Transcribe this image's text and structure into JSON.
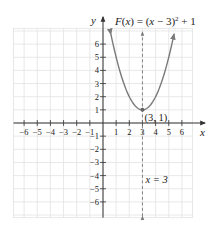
{
  "chart_data": {
    "type": "line",
    "function": {
      "name": "F",
      "expression": "(x - 3)^2 + 1",
      "label": "F(x) = (x − 3)² + 1",
      "color": "#7a7a7a",
      "x_domain": [
        0.6,
        5.4
      ],
      "points": [
        {
          "x": 0.6,
          "y": 6.76
        },
        {
          "x": 1,
          "y": 5
        },
        {
          "x": 2,
          "y": 2
        },
        {
          "x": 3,
          "y": 1
        },
        {
          "x": 4,
          "y": 2
        },
        {
          "x": 5,
          "y": 5
        },
        {
          "x": 5.4,
          "y": 6.76
        }
      ]
    },
    "vertex": {
      "x": 3,
      "y": 1,
      "label": "(3, 1)"
    },
    "axis_of_symmetry": {
      "x": 3,
      "label": "x = 3",
      "style": "dashed"
    },
    "xlabel": "x",
    "ylabel": "y",
    "xlim": [
      -7,
      7
    ],
    "ylim": [
      -7,
      7
    ],
    "x_ticks": [
      -6,
      -5,
      -4,
      -3,
      -2,
      -1,
      1,
      2,
      3,
      4,
      5,
      6
    ],
    "x_tick_labels": [
      "−6",
      "−5",
      "−4",
      "−3",
      "−2",
      "−1",
      "1",
      "2",
      "3",
      "4",
      "5",
      "6"
    ],
    "y_ticks": [
      6,
      5,
      4,
      3,
      2,
      1,
      -1,
      -2,
      -3,
      -4,
      -5,
      -6
    ],
    "y_tick_labels": [
      "6",
      "5",
      "4",
      "3",
      "2",
      "1",
      "−1",
      "−2",
      "−3",
      "−4",
      "−5",
      "−6"
    ],
    "grid": true,
    "colors": {
      "grid": "#e2e2e2",
      "axis": "#333333",
      "curve": "#7a7a7a",
      "dashed": "#777777"
    }
  }
}
